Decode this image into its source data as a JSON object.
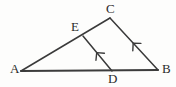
{
  "figure": {
    "kind": "geometry-diagram",
    "background_color": "#fdfdfc",
    "stroke_color": "#3a3a3a",
    "base_stroke_color": "#3c3c3c",
    "label_color": "#2b2b2b",
    "width": 176,
    "height": 87,
    "points": {
      "A": {
        "label": "A",
        "x": 21,
        "y": 71
      },
      "B": {
        "label": "B",
        "x": 158,
        "y": 70
      },
      "C": {
        "label": "C",
        "x": 110,
        "y": 18
      },
      "D": {
        "label": "D",
        "x": 112,
        "y": 71
      },
      "E": {
        "label": "E",
        "x": 83,
        "y": 36
      }
    },
    "segments": [
      {
        "name": "AB",
        "from": "A",
        "to": "B",
        "width": 2.1,
        "tick_marks": 0,
        "arrow": "none"
      },
      {
        "name": "AC",
        "from": "A",
        "to": "C",
        "width": 1.5,
        "tick_marks": 0,
        "arrow": "none"
      },
      {
        "name": "CB",
        "from": "C",
        "to": "B",
        "width": 1.5,
        "tick_marks": 0,
        "arrow": "mid-forward"
      },
      {
        "name": "ED",
        "from": "E",
        "to": "D",
        "width": 1.5,
        "tick_marks": 0,
        "arrow": "mid-forward"
      }
    ],
    "arrow_markers": [
      {
        "name": "arrow-ED",
        "on_segment": "ED",
        "position": 0.5,
        "direction": "toward-D",
        "meaning": "parallel-mark"
      },
      {
        "name": "arrow-CB",
        "on_segment": "CB",
        "position": 0.5,
        "direction": "toward-B",
        "meaning": "parallel-mark"
      }
    ],
    "parallel_pairs": [
      [
        "ED",
        "CB"
      ]
    ]
  }
}
